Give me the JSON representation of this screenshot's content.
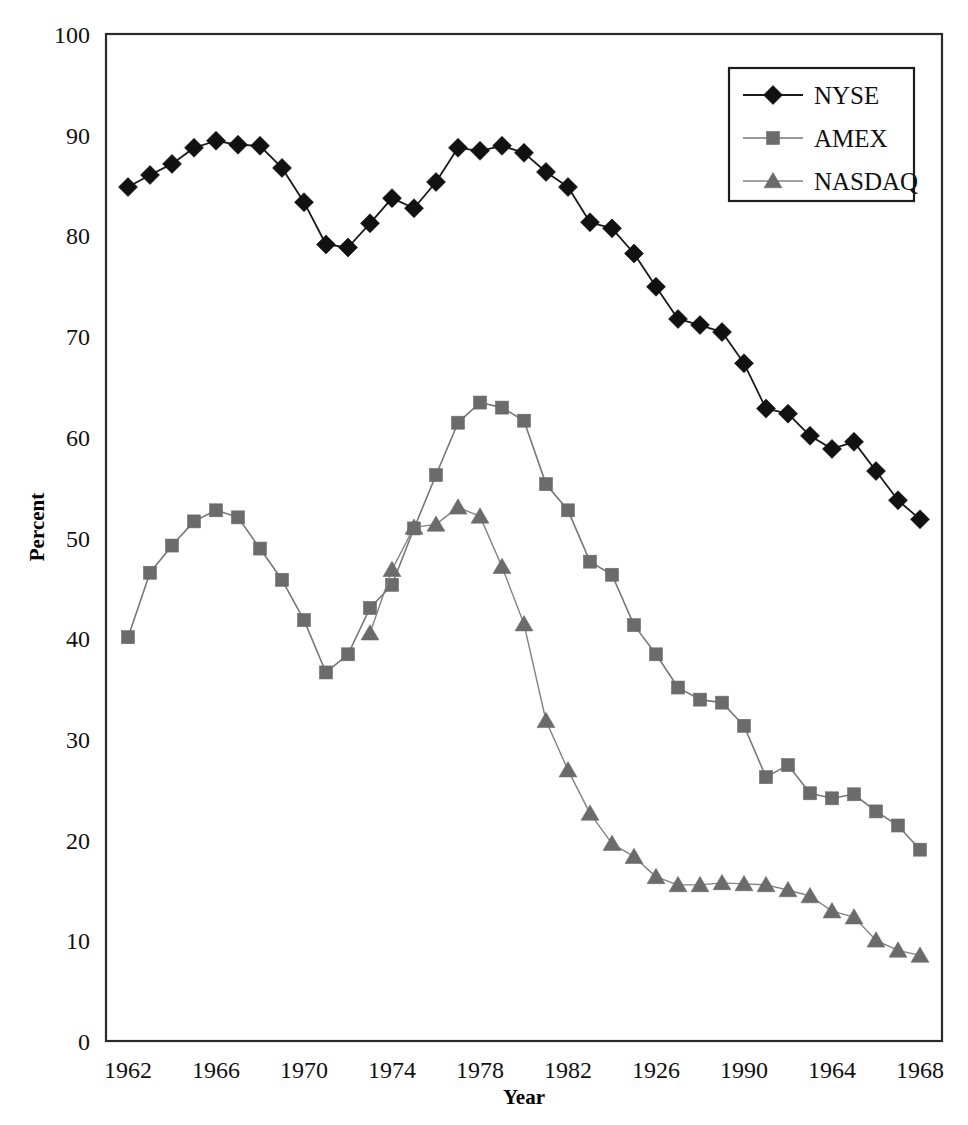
{
  "chart_data": {
    "type": "line",
    "title": "",
    "xlabel": "Year",
    "ylabel": "Percent",
    "ylim": [
      0,
      100
    ],
    "ytick_values": [
      0,
      10,
      20,
      30,
      40,
      50,
      60,
      70,
      80,
      90,
      100
    ],
    "ytick_labels": [
      "0",
      "10",
      "20",
      "30",
      "40",
      "50",
      "60",
      "70",
      "80",
      "90",
      "100"
    ],
    "xlim": [
      1961,
      1999
    ],
    "xtick_values": [
      1962,
      1966,
      1970,
      1974,
      1978,
      1982,
      1986,
      1990,
      1994,
      1998
    ],
    "xtick_labels": [
      "1962",
      "1966",
      "1970",
      "1974",
      "1978",
      "1982",
      "1926",
      "1990",
      "1964",
      "1968"
    ],
    "grid": "horizontal",
    "legend_position": "top-right",
    "x": [
      1962,
      1963,
      1964,
      1965,
      1966,
      1967,
      1968,
      1969,
      1970,
      1971,
      1972,
      1973,
      1974,
      1975,
      1976,
      1977,
      1978,
      1979,
      1980,
      1981,
      1982,
      1983,
      1984,
      1985,
      1986,
      1987,
      1988,
      1989,
      1990,
      1991,
      1992,
      1993,
      1994,
      1995,
      1996,
      1997,
      1998
    ],
    "series": [
      {
        "name": "NYSE",
        "marker": "diamond",
        "color": "#111111",
        "line_color": "#1a1a1a",
        "line_width": 1.8,
        "values": [
          84.8,
          86.0,
          87.1,
          88.7,
          89.4,
          89.0,
          88.9,
          86.7,
          83.3,
          79.1,
          78.8,
          81.2,
          83.7,
          82.7,
          85.3,
          88.7,
          88.4,
          88.9,
          88.2,
          86.3,
          84.8,
          81.3,
          80.7,
          78.2,
          74.9,
          71.7,
          71.1,
          70.4,
          67.3,
          62.8,
          62.3,
          60.1,
          58.8,
          59.5,
          56.6,
          53.7,
          51.8
        ]
      },
      {
        "name": "AMEX",
        "marker": "square",
        "color": "#6b6b6b",
        "line_color": "#777777",
        "line_width": 1.6,
        "values": [
          40.1,
          46.5,
          49.2,
          51.6,
          52.7,
          52.0,
          48.9,
          45.8,
          41.8,
          36.6,
          38.4,
          43.0,
          45.3,
          50.9,
          56.2,
          61.4,
          63.4,
          62.9,
          61.6,
          55.3,
          52.7,
          47.6,
          46.3,
          41.3,
          38.4,
          35.1,
          33.9,
          33.6,
          31.3,
          26.2,
          27.4,
          24.6,
          24.1,
          24.5,
          22.8,
          21.4,
          19.0
        ]
      },
      {
        "name": "NASDAQ",
        "marker": "triangle",
        "color": "#6b6b6b",
        "line_color": "#828282",
        "line_width": 1.4,
        "values": [
          null,
          null,
          null,
          null,
          null,
          null,
          null,
          null,
          null,
          null,
          null,
          40.5,
          46.8,
          51.0,
          51.3,
          53.0,
          52.1,
          47.1,
          41.4,
          31.8,
          26.9,
          22.6,
          19.6,
          18.3,
          16.3,
          15.5,
          15.5,
          15.7,
          15.6,
          15.5,
          15.0,
          14.4,
          12.9,
          12.3,
          10.0,
          9.0,
          8.5
        ]
      }
    ]
  },
  "legend": {
    "entries": [
      {
        "label": "NYSE"
      },
      {
        "label": "AMEX"
      },
      {
        "label": "NASDAQ"
      }
    ]
  }
}
